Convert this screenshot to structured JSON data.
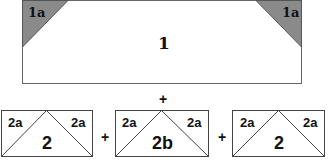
{
  "top_piece": {
    "label": "1",
    "corner_left_label": "1a",
    "corner_right_label": "1a",
    "corner_fill": "#8a8a8a"
  },
  "plus_top": "+",
  "bottom_pieces": [
    {
      "label": "2",
      "left_label": "2a",
      "right_label": "2a"
    },
    {
      "label": "2b",
      "left_label": "2a",
      "right_label": "2a"
    },
    {
      "label": "2",
      "left_label": "2a",
      "right_label": "2a"
    }
  ],
  "plus_between": [
    "+",
    "+"
  ],
  "colors": {
    "stroke": "#555555",
    "fill": "#ffffff",
    "shade": "#8a8a8a"
  }
}
